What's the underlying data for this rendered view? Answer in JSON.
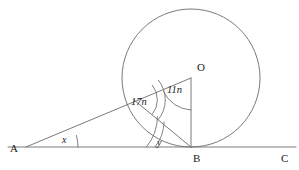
{
  "figure": {
    "background_color": "#ffffff",
    "stroke_color": "#6b6b6b",
    "text_color": "#1a1a1a"
  },
  "points": {
    "A": {
      "label": "A",
      "x": 28,
      "y": 147
    },
    "B": {
      "label": "B",
      "x": 196,
      "y": 147
    },
    "C": {
      "label": "C",
      "x": 288,
      "y": 147
    },
    "O": {
      "label": "O",
      "x": 191,
      "y": 78
    },
    "P": {
      "label": "",
      "x": 134,
      "y": 100
    }
  },
  "point_labels": [
    {
      "name": "label-A",
      "text": "A",
      "x": 10,
      "y": 152
    },
    {
      "name": "label-B",
      "text": "B",
      "x": 193,
      "y": 162
    },
    {
      "name": "label-C",
      "text": "C",
      "x": 281,
      "y": 162
    },
    {
      "name": "label-O",
      "text": "O",
      "x": 197,
      "y": 71
    }
  ],
  "angles": [
    {
      "name": "angle-x-at-A",
      "label": "x",
      "vertex": "A",
      "label_x": 62,
      "label_y": 143,
      "arc_count": 1,
      "description": "angle between ray AC and ray AO at vertex A"
    },
    {
      "name": "angle-17n-at-P",
      "label": "17n",
      "label_x": 133,
      "label_y": 105,
      "arc_count": 2,
      "description": "angle at circle point P between PO and PB"
    },
    {
      "name": "angle-11n-at-O",
      "label": "11n",
      "label_x": 168,
      "label_y": 93,
      "arc_count": 1,
      "description": "angle at centre O between OA and OB"
    },
    {
      "name": "angle-y-at-B",
      "label": "y",
      "label_x": 157,
      "label_y": 146,
      "arc_count": 2,
      "description": "angle at B between BA and BP"
    }
  ],
  "circle": {
    "name": "main-circle",
    "center_x": 191,
    "center_y": 78,
    "radius": 69
  },
  "segments": [
    {
      "name": "line-AC",
      "from": "A",
      "to": "C",
      "extends_left_to_x": 8,
      "extends_right_to_x": 296
    },
    {
      "name": "line-AO",
      "from": "A",
      "to": "O"
    },
    {
      "name": "line-OB",
      "from": "O",
      "to": "B"
    },
    {
      "name": "line-PB",
      "from": "P",
      "to": "B"
    }
  ]
}
